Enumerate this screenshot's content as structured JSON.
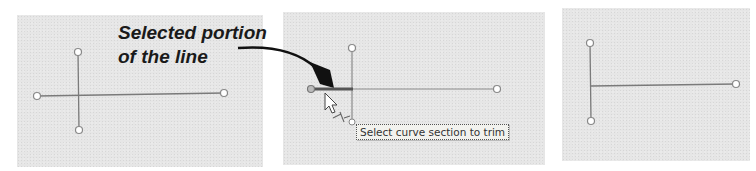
{
  "callout": {
    "line1": "Selected portion",
    "line2": "of the line"
  },
  "tooltip": {
    "text": "Select curve section to trim"
  },
  "panels": [
    {
      "name": "before-trim",
      "description": "Two intersecting curves"
    },
    {
      "name": "during-trim",
      "description": "Selected segment highlighted with cursor"
    },
    {
      "name": "after-trim",
      "description": "Curve trimmed at intersection"
    }
  ],
  "icons": {
    "cursor": "arrow-cursor-with-trim-icon",
    "callout_arrow": "curved-arrow"
  },
  "colors": {
    "panel_bg": "#e6e6e6",
    "line": "#7a7a7a",
    "selected_line": "#4a4a4a",
    "arrow": "#111111",
    "text": "#1a1a1a"
  }
}
